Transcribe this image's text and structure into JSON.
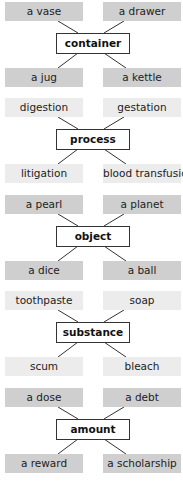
{
  "diagram": {
    "type": "word-category-clusters",
    "groups": [
      {
        "category": "container",
        "shade": "dark",
        "top_left": "a vase",
        "top_right": "a drawer",
        "bottom_left": "a jug",
        "bottom_right": "a kettle"
      },
      {
        "category": "process",
        "shade": "light",
        "top_left": "digestion",
        "top_right": "gestation",
        "bottom_left": "litigation",
        "bottom_right": "blood transfusion"
      },
      {
        "category": "object",
        "shade": "dark",
        "top_left": "a pearl",
        "top_right": "a planet",
        "bottom_left": "a dice",
        "bottom_right": "a ball"
      },
      {
        "category": "substance",
        "shade": "light",
        "top_left": "toothpaste",
        "top_right": "soap",
        "bottom_left": "scum",
        "bottom_right": "bleach"
      },
      {
        "category": "amount",
        "shade": "dark",
        "top_left": "a dose",
        "top_right": "a debt",
        "bottom_left": "a reward",
        "bottom_right": "a scholarship"
      }
    ]
  },
  "colors": {
    "dark_box": "#cfcfcf",
    "light_box": "#ececec",
    "hub_border": "#333333",
    "line": "#333333"
  }
}
